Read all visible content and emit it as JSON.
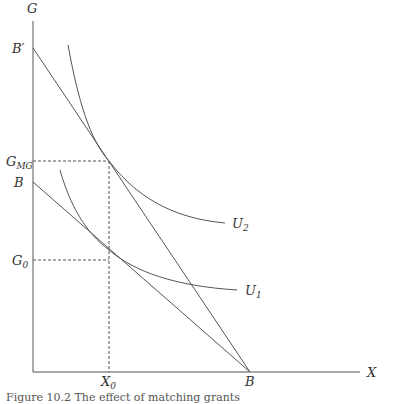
{
  "diagram": {
    "axes": {
      "y_label": "G",
      "x_label": "X"
    },
    "points": {
      "b_prime": "B′",
      "b_y": "B",
      "b_x": "B",
      "g_mg": "G",
      "g_mg_sub": "MG",
      "g_0": "G",
      "g_0_sub": "0",
      "x_0": "X",
      "x_0_sub": "0"
    },
    "curves": {
      "u2": "U",
      "u2_sub": "2",
      "u1": "U",
      "u1_sub": "1"
    },
    "lines": [
      {
        "name": "original-budget-line",
        "from": "B (G-axis)",
        "to": "B (X-axis)"
      },
      {
        "name": "matching-grant-budget-line",
        "from": "B′",
        "to": "B (X-axis)"
      }
    ],
    "colors": {
      "line": "#555555",
      "text": "#333333"
    }
  },
  "caption": "Figure 10.2  The effect of matching grants"
}
